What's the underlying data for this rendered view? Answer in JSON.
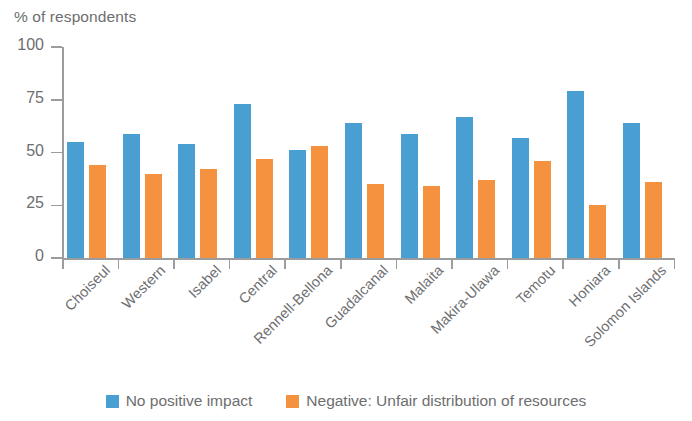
{
  "chart_data": {
    "type": "bar",
    "title": "",
    "ylabel": "% of respondents",
    "xlabel": "",
    "ylim": [
      0,
      100
    ],
    "yticks": [
      0,
      25,
      50,
      75,
      100
    ],
    "grid": false,
    "legend_position": "bottom",
    "categories": [
      "Choiseul",
      "Western",
      "Isabel",
      "Central",
      "Rennell-Bellona",
      "Guadalcanal",
      "Malaita",
      "Makira-Ulawa",
      "Temotu",
      "Honiara",
      "Solomon Islands"
    ],
    "series": [
      {
        "name": "No positive impact",
        "color": "#4a9fd2",
        "values": [
          55,
          59,
          54,
          73,
          51,
          64,
          59,
          67,
          57,
          79,
          64
        ]
      },
      {
        "name": "Negative: Unfair distribution of resources",
        "color": "#f4923f",
        "values": [
          44,
          40,
          42,
          47,
          53,
          35,
          34,
          37,
          46,
          25,
          36
        ]
      }
    ]
  },
  "axis": {
    "y_title": "% of respondents"
  },
  "legend": {
    "items": [
      {
        "label": "No positive impact",
        "color": "#4a9fd2"
      },
      {
        "label": "Negative: Unfair distribution of resources",
        "color": "#f4923f"
      }
    ]
  }
}
